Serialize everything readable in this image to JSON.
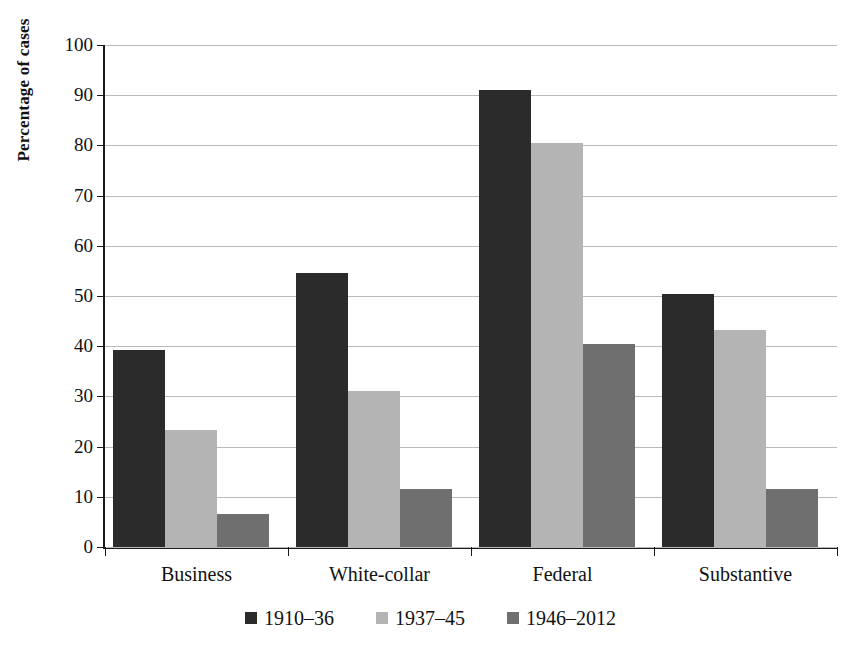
{
  "chart_data": {
    "type": "bar",
    "title": "",
    "xlabel": "",
    "ylabel": "Percentage of cases",
    "categories": [
      "Business",
      "White-collar",
      "Federal",
      "Substantive"
    ],
    "series": [
      {
        "name": "1910–36",
        "color": "#2b2b2b",
        "values": [
          39.2,
          54.5,
          91.0,
          50.5
        ]
      },
      {
        "name": "1937–45",
        "color": "#b4b4b4",
        "values": [
          23.3,
          31.0,
          80.5,
          43.2
        ]
      },
      {
        "name": "1946–2012",
        "color": "#6f6f6f",
        "values": [
          6.5,
          11.5,
          40.5,
          11.6
        ]
      }
    ],
    "ylim": [
      0,
      100
    ],
    "ytick_labels": [
      "0",
      "10",
      "20",
      "30",
      "40",
      "50",
      "60",
      "70",
      "80",
      "90",
      "100"
    ],
    "ytick_values": [
      0,
      10,
      20,
      30,
      40,
      50,
      60,
      70,
      80,
      90,
      100
    ],
    "grid": true,
    "legend_position": "bottom"
  }
}
